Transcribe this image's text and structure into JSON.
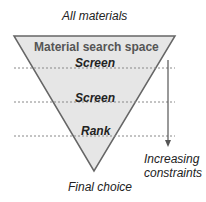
{
  "top_label": "All materials",
  "funnel": {
    "header": "Material search space",
    "stages": [
      "Screen",
      "Screen",
      "Rank"
    ],
    "fill_color": "#e6e6e6",
    "stroke_color": "#666666"
  },
  "arrow_label_line1": "Increasing",
  "arrow_label_line2": "constraints",
  "bottom_label": "Final choice"
}
